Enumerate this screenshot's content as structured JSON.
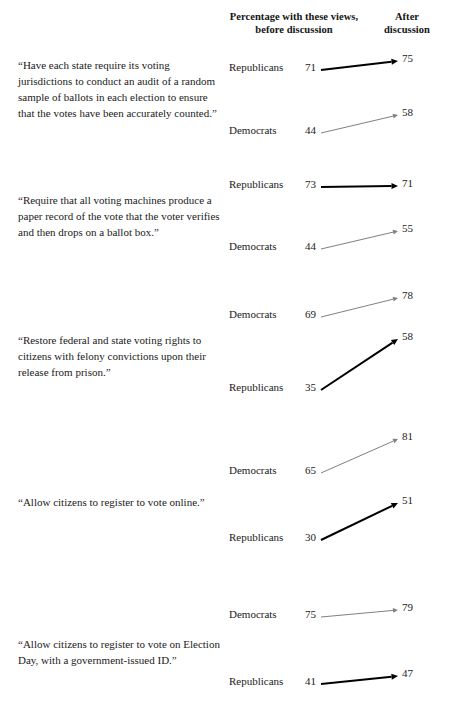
{
  "header": {
    "before_label_line1": "Percentage with these views,",
    "before_label_line2": "before discussion",
    "after_label_line1": "After",
    "after_label_line2": "discussion"
  },
  "colors": {
    "republican_line": "#000000",
    "democrat_line": "#808080",
    "text": "#1a1a1a",
    "background": "#ffffff"
  },
  "chart_data": {
    "type": "line",
    "title": "",
    "subtitle": "",
    "xlabel": "",
    "ylabel": "Percentage with these views",
    "x": [
      "before discussion",
      "After discussion"
    ],
    "legend": [
      "Republicans",
      "Democrats"
    ],
    "grid": false,
    "legend_position": "inline-row-labels",
    "groups": [
      {
        "statement": "“Have each state require its voting jurisdictions to conduct an audit of a random sample of ballots in each election to ensure that the votes have been accurately counted.”",
        "rows": [
          {
            "party": "Republicans",
            "before": 71,
            "after": 75
          },
          {
            "party": "Democrats",
            "before": 44,
            "after": 58
          }
        ]
      },
      {
        "statement": "“Require that all voting machines produce a paper record of the vote that the voter verifies and then drops on a ballot box.”",
        "rows": [
          {
            "party": "Republicans",
            "before": 73,
            "after": 71
          },
          {
            "party": "Democrats",
            "before": 44,
            "after": 55
          }
        ]
      },
      {
        "statement": "“Restore federal and state voting rights to citizens with felony convictions upon their release from prison.”",
        "rows": [
          {
            "party": "Democrats",
            "before": 69,
            "after": 78
          },
          {
            "party": "Republicans",
            "before": 35,
            "after": 58
          }
        ]
      },
      {
        "statement": "“Allow citizens to register to vote online.”",
        "rows": [
          {
            "party": "Democrats",
            "before": 65,
            "after": 81
          },
          {
            "party": "Republicans",
            "before": 30,
            "after": 51
          }
        ]
      },
      {
        "statement": "“Allow citizens to register to vote on Election Day, with a government-issued ID.”",
        "rows": [
          {
            "party": "Democrats",
            "before": 75,
            "after": 79
          },
          {
            "party": "Republicans",
            "before": 41,
            "after": 47
          }
        ]
      }
    ]
  },
  "layout": {
    "statement_tops": [
      58,
      193,
      333,
      495,
      637
    ],
    "row_label_y": [
      [
        61,
        124
      ],
      [
        178,
        240
      ],
      [
        308,
        381
      ],
      [
        464,
        531
      ],
      [
        608,
        675
      ]
    ],
    "row_after_y": [
      [
        52,
        106
      ],
      [
        177,
        222
      ],
      [
        289,
        330
      ],
      [
        430,
        494
      ],
      [
        601,
        667
      ]
    ]
  }
}
